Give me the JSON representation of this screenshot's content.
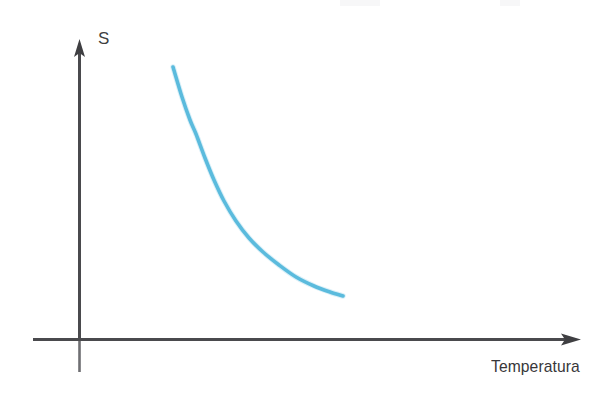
{
  "figure": {
    "background_color": "#ffffff",
    "axis_color": "#4a4a4d",
    "curve_color": "#5cbcdd",
    "label_color": "#3a3a3c"
  },
  "labels": {
    "y_axis": "S",
    "x_axis": "Temperatura"
  },
  "icons": {
    "y_axis_arrow": "arrow-up-icon",
    "x_axis_arrow": "arrow-right-icon"
  },
  "chart_data": {
    "type": "line",
    "title": "",
    "xlabel": "Temperatura",
    "ylabel": "S",
    "grid": false,
    "legend": null,
    "axes": {
      "x_origin_px": 79,
      "y_origin_px": 339,
      "x_arrow_tip_px": 580,
      "y_arrow_tip_px": 40,
      "x_axis_start_px": 33,
      "y_axis_end_px": 372,
      "xlim": [
        0,
        1
      ],
      "ylim": [
        0,
        1
      ],
      "ticks": [],
      "tick_labels": []
    },
    "series": [
      {
        "name": "S(T)",
        "color": "#5cbcdd",
        "line_width": 3.6,
        "description": "Monotonically decreasing convex curve (entropy falls as temperature rises)",
        "points_px": [
          [
            173,
            67
          ],
          [
            182,
            97
          ],
          [
            190,
            120
          ],
          [
            196,
            134
          ],
          [
            205,
            158
          ],
          [
            214,
            180
          ],
          [
            224,
            201
          ],
          [
            236,
            221
          ],
          [
            249,
            238
          ],
          [
            263,
            252
          ],
          [
            279,
            265
          ],
          [
            296,
            277
          ],
          [
            314,
            286
          ],
          [
            330,
            292
          ],
          [
            343,
            296
          ]
        ],
        "x": [
          0.19,
          0.3,
          0.39,
          0.47,
          0.57,
          0.66,
          0.76,
          0.86,
          0.95,
          1.04,
          1.11
        ],
        "y": [
          0.91,
          0.78,
          0.69,
          0.61,
          0.52,
          0.45,
          0.38,
          0.31,
          0.25,
          0.2,
          0.17
        ]
      }
    ]
  }
}
